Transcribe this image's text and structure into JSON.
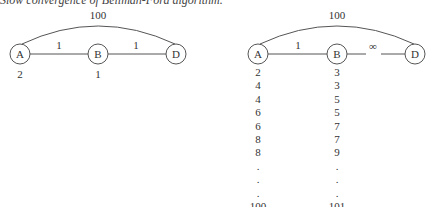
{
  "title": "Slow convergence of Bellman-Ford algorithm.",
  "left_graph": {
    "nodes": [
      {
        "id": "A",
        "label": "A",
        "cx": 20,
        "cy": 54,
        "distance": "2"
      },
      {
        "id": "B",
        "label": "B",
        "cx": 98,
        "cy": 54,
        "distance": "1"
      },
      {
        "id": "D",
        "label": "D",
        "cx": 176,
        "cy": 54,
        "distance": ""
      }
    ],
    "edges": [
      {
        "from": "A",
        "to": "B",
        "weight": "1"
      },
      {
        "from": "B",
        "to": "D",
        "weight": "1"
      },
      {
        "from": "A",
        "to": "D",
        "weight": "100",
        "curved": true
      }
    ]
  },
  "right_graph": {
    "nodes": [
      {
        "id": "A",
        "label": "A",
        "cx": 258,
        "cy": 54
      },
      {
        "id": "B",
        "label": "B",
        "cx": 337,
        "cy": 54
      },
      {
        "id": "D",
        "label": "D",
        "cx": 415,
        "cy": 54
      }
    ],
    "edges": [
      {
        "from": "A",
        "to": "B",
        "weight": "1"
      },
      {
        "from": "B",
        "to": "D",
        "weight": "∞",
        "broken": true
      },
      {
        "from": "A",
        "to": "D",
        "weight": "100",
        "curved": true
      }
    ],
    "a_distances": [
      "2",
      "4",
      "4",
      "6",
      "6",
      "8",
      "8",
      ".",
      ".",
      ".",
      "100"
    ],
    "b_distances": [
      "3",
      "3",
      "5",
      "5",
      "7",
      "7",
      "9",
      ".",
      ".",
      ".",
      "101"
    ]
  }
}
